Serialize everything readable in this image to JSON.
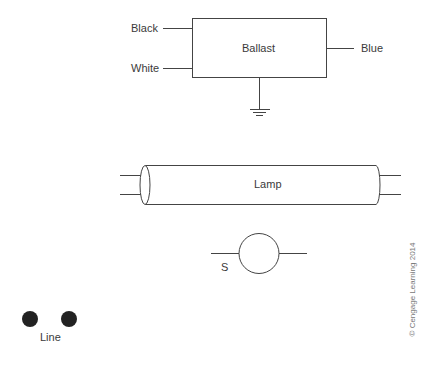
{
  "ballast": {
    "label": "Ballast",
    "inputs": [
      "Black",
      "White"
    ],
    "output": "Blue",
    "ground": "ground-symbol"
  },
  "lamp": {
    "label": "Lamp"
  },
  "switch": {
    "label": "S"
  },
  "line": {
    "label": "Line",
    "terminals": 2
  },
  "copyright": "© Cengage Learning 2014",
  "colors": {
    "stroke": "#444444",
    "terminal_fill": "#222222"
  }
}
